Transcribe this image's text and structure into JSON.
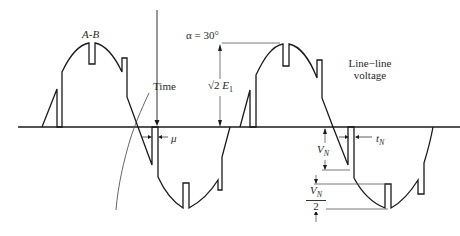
{
  "diagram": {
    "colors": {
      "ink": "#1a1a1a",
      "guide": "#555555",
      "background": "#ffffff"
    },
    "labels": {
      "waveform_label": "A-B",
      "time_label": "Time",
      "alpha_label": "α = 30°",
      "amplitude_label_root": "√2",
      "amplitude_label_var": "E",
      "amplitude_label_sub": "1",
      "line_line_1": "Line−line",
      "line_line_2": "voltage",
      "mu_label": "μ",
      "notch_depth_label": "V",
      "notch_depth_sub": "N",
      "notch_width_label": "t",
      "notch_width_sub": "N",
      "half_notch_num": "V",
      "half_notch_num_sub": "N",
      "half_notch_den": "2"
    }
  }
}
